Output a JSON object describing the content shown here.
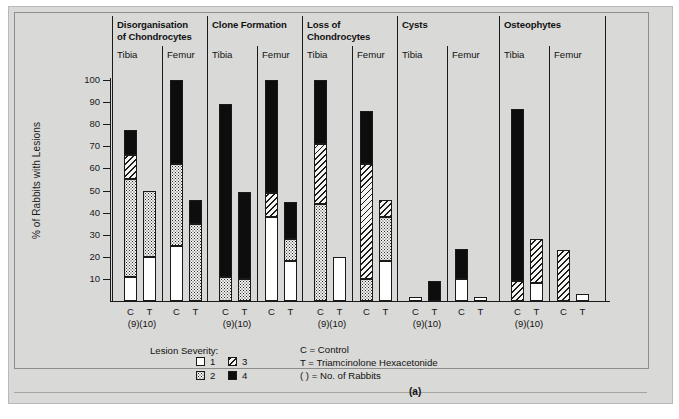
{
  "figure": {
    "label": "(a)",
    "y_axis_title": "% of Rabbits with Lesions"
  },
  "axis": {
    "ticks": [
      100,
      90,
      80,
      70,
      60,
      50,
      40,
      30,
      20,
      10
    ],
    "ymin": 0,
    "ymax": 100
  },
  "groups": [
    {
      "title_line1": "Disorganisation",
      "title_line2": "of Chondrocytes",
      "sites": [
        "Tibia",
        "Femur"
      ]
    },
    {
      "title_line1": "Clone Formation",
      "title_line2": "",
      "sites": [
        "Tibia",
        "Femur"
      ]
    },
    {
      "title_line1": "Loss of",
      "title_line2": "Chondrocytes",
      "sites": [
        "Tibia",
        "Femur"
      ]
    },
    {
      "title_line1": "Cysts",
      "title_line2": "",
      "sites": [
        "Tibia",
        "Femur"
      ]
    },
    {
      "title_line1": "Osteophytes",
      "title_line2": "",
      "sites": [
        "Tibia",
        "Femur"
      ]
    }
  ],
  "x_tick_labels": {
    "control": "C",
    "treated": "T",
    "counts": "(9)(10)"
  },
  "legend": {
    "title": "Lesion Severity:",
    "items": [
      {
        "swatch": "sev1",
        "label": "1"
      },
      {
        "swatch": "sev2",
        "label": "2"
      },
      {
        "swatch": "sev3",
        "label": "3"
      },
      {
        "swatch": "sev4",
        "label": "4"
      }
    ],
    "notes": [
      "C = Control",
      "T = Triamcinolone Hexacetonide",
      "( ) = No. of Rabbits"
    ]
  },
  "colors": {
    "panel_background": "#d9d9d7",
    "ink": "#1a1a1a",
    "severity_1": "#ffffff",
    "severity_4": "#0d0d0d"
  },
  "chart_data": {
    "type": "bar",
    "title": "",
    "xlabel": "",
    "ylabel": "% of Rabbits with Lesions",
    "ylim": [
      0,
      100
    ],
    "grid": false,
    "legend_position": "bottom-left",
    "stacked": true,
    "series": [
      {
        "name": "1",
        "pattern": "white"
      },
      {
        "name": "2",
        "pattern": "dotted"
      },
      {
        "name": "3",
        "pattern": "diagonal-hatch"
      },
      {
        "name": "4",
        "pattern": "solid-black"
      }
    ],
    "categories": [
      "Disorganisation of Chondrocytes / Tibia / C",
      "Disorganisation of Chondrocytes / Tibia / T",
      "Disorganisation of Chondrocytes / Femur / C",
      "Disorganisation of Chondrocytes / Femur / T",
      "Clone Formation / Tibia / C",
      "Clone Formation / Tibia / T",
      "Clone Formation / Femur / C",
      "Clone Formation / Femur / T",
      "Loss of Chondrocytes / Tibia / C",
      "Loss of Chondrocytes / Tibia / T",
      "Loss of Chondrocytes / Femur / C",
      "Loss of Chondrocytes / Femur / T",
      "Cysts / Tibia / C",
      "Cysts / Tibia / T",
      "Cysts / Femur / C",
      "Cysts / Femur / T",
      "Osteophytes / Tibia / C",
      "Osteophytes / Tibia / T",
      "Osteophytes / Femur / C",
      "Osteophytes / Femur / T"
    ],
    "bars": [
      {
        "group": 0,
        "site": "Tibia",
        "treatment": "C",
        "total": 77.5,
        "segments": [
          {
            "severity": 1,
            "from": 0,
            "to": 11
          },
          {
            "severity": 2,
            "from": 11,
            "to": 55
          },
          {
            "severity": 3,
            "from": 55,
            "to": 66
          },
          {
            "severity": 4,
            "from": 66,
            "to": 77.5
          }
        ]
      },
      {
        "group": 0,
        "site": "Tibia",
        "treatment": "T",
        "total": 50,
        "segments": [
          {
            "severity": 1,
            "from": 0,
            "to": 20
          },
          {
            "severity": 2,
            "from": 20,
            "to": 50
          }
        ]
      },
      {
        "group": 0,
        "site": "Femur",
        "treatment": "C",
        "total": 100,
        "segments": [
          {
            "severity": 1,
            "from": 0,
            "to": 25
          },
          {
            "severity": 2,
            "from": 25,
            "to": 62
          },
          {
            "severity": 4,
            "from": 62,
            "to": 100
          }
        ]
      },
      {
        "group": 0,
        "site": "Femur",
        "treatment": "T",
        "total": 45.5,
        "segments": [
          {
            "severity": 2,
            "from": 0,
            "to": 35
          },
          {
            "severity": 4,
            "from": 35,
            "to": 45.5
          }
        ]
      },
      {
        "group": 1,
        "site": "Tibia",
        "treatment": "C",
        "total": 89,
        "segments": [
          {
            "severity": 2,
            "from": 0,
            "to": 11
          },
          {
            "severity": 4,
            "from": 11,
            "to": 89
          }
        ]
      },
      {
        "group": 1,
        "site": "Tibia",
        "treatment": "T",
        "total": 49.5,
        "segments": [
          {
            "severity": 2,
            "from": 0,
            "to": 10
          },
          {
            "severity": 4,
            "from": 10,
            "to": 49.5
          }
        ]
      },
      {
        "group": 1,
        "site": "Femur",
        "treatment": "C",
        "total": 100,
        "segments": [
          {
            "severity": 1,
            "from": 0,
            "to": 38
          },
          {
            "severity": 3,
            "from": 38,
            "to": 49
          },
          {
            "severity": 4,
            "from": 49,
            "to": 100
          }
        ]
      },
      {
        "group": 1,
        "site": "Femur",
        "treatment": "T",
        "total": 45,
        "segments": [
          {
            "severity": 1,
            "from": 0,
            "to": 18
          },
          {
            "severity": 2,
            "from": 18,
            "to": 28
          },
          {
            "severity": 4,
            "from": 28,
            "to": 45
          }
        ]
      },
      {
        "group": 2,
        "site": "Tibia",
        "treatment": "C",
        "total": 100,
        "segments": [
          {
            "severity": 2,
            "from": 0,
            "to": 44
          },
          {
            "severity": 3,
            "from": 44,
            "to": 71
          },
          {
            "severity": 4,
            "from": 71,
            "to": 100
          }
        ]
      },
      {
        "group": 2,
        "site": "Tibia",
        "treatment": "T",
        "total": 20,
        "segments": [
          {
            "severity": 1,
            "from": 0,
            "to": 20
          }
        ]
      },
      {
        "group": 2,
        "site": "Femur",
        "treatment": "C",
        "total": 86,
        "segments": [
          {
            "severity": 2,
            "from": 0,
            "to": 10
          },
          {
            "severity": 3,
            "from": 10,
            "to": 62
          },
          {
            "severity": 4,
            "from": 62,
            "to": 86
          }
        ]
      },
      {
        "group": 2,
        "site": "Femur",
        "treatment": "T",
        "total": 45.5,
        "segments": [
          {
            "severity": 1,
            "from": 0,
            "to": 18
          },
          {
            "severity": 2,
            "from": 18,
            "to": 38
          },
          {
            "severity": 3,
            "from": 38,
            "to": 45.5
          }
        ]
      },
      {
        "group": 3,
        "site": "Tibia",
        "treatment": "C",
        "total": 2,
        "segments": [
          {
            "severity": 1,
            "from": 0,
            "to": 2
          }
        ]
      },
      {
        "group": 3,
        "site": "Tibia",
        "treatment": "T",
        "total": 9,
        "segments": [
          {
            "severity": 4,
            "from": 0,
            "to": 9
          }
        ]
      },
      {
        "group": 3,
        "site": "Femur",
        "treatment": "C",
        "total": 23.5,
        "segments": [
          {
            "severity": 1,
            "from": 0,
            "to": 10
          },
          {
            "severity": 4,
            "from": 10,
            "to": 23.5
          }
        ]
      },
      {
        "group": 3,
        "site": "Femur",
        "treatment": "T",
        "total": 2,
        "segments": [
          {
            "severity": 1,
            "from": 0,
            "to": 2
          }
        ]
      },
      {
        "group": 4,
        "site": "Tibia",
        "treatment": "C",
        "total": 87,
        "segments": [
          {
            "severity": 3,
            "from": 0,
            "to": 9
          },
          {
            "severity": 4,
            "from": 9,
            "to": 87
          }
        ]
      },
      {
        "group": 4,
        "site": "Tibia",
        "treatment": "T",
        "total": 28,
        "segments": [
          {
            "severity": 1,
            "from": 0,
            "to": 8
          },
          {
            "severity": 3,
            "from": 8,
            "to": 28
          }
        ]
      },
      {
        "group": 4,
        "site": "Femur",
        "treatment": "C",
        "total": 23,
        "segments": [
          {
            "severity": 3,
            "from": 0,
            "to": 23
          }
        ]
      },
      {
        "group": 4,
        "site": "Femur",
        "treatment": "T",
        "total": 3,
        "segments": [
          {
            "severity": 1,
            "from": 0,
            "to": 3
          }
        ]
      }
    ]
  }
}
